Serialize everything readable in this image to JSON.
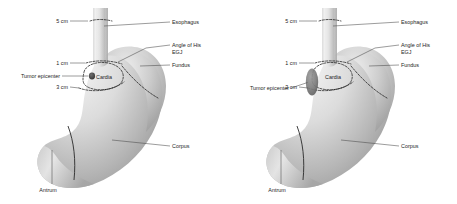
{
  "figure": {
    "background_color": "#ffffff",
    "ink_color": "#1d1d1d",
    "leader_color": "#4a4a4a",
    "dash_color": "#1b1b1b"
  },
  "labels": {
    "esophagus": "Esophagus",
    "angle_of_his": "Angle of His",
    "egj": "EGJ",
    "fundus": "Fundus",
    "corpus": "Corpus",
    "antrum": "Antrum",
    "cardia": "Cardia",
    "tumor_epicenter": "Tumor epicenter",
    "m5cm": "5 cm",
    "m1cm": "1 cm",
    "m3cm": "3 cm"
  },
  "panels": [
    {
      "id": "panel-left",
      "name": "stomach-diagram-left",
      "tumor": {
        "shape": "small-round",
        "cx": 92,
        "cy": 76,
        "rx": 3.1,
        "ry": 3.4
      },
      "tumor_label_y": 77,
      "tumor_leader": {
        "x1": 62,
        "y1": 76,
        "x2": 88.4,
        "y2": 76
      }
    },
    {
      "id": "panel-right",
      "name": "stomach-diagram-right",
      "tumor": {
        "shape": "large-oval",
        "cx": 83,
        "cy": 82,
        "rx": 6.2,
        "ry": 13.5
      },
      "tumor_label_y": 89,
      "tumor_leader": {
        "x1": 62,
        "y1": 88,
        "x2": 78.5,
        "y2": 82.5
      }
    }
  ],
  "measures": [
    {
      "key": "m5cm",
      "text": "5 cm",
      "x": 57,
      "y": 22.5
    },
    {
      "key": "m1cm",
      "text": "1 cm",
      "x": 57,
      "y": 64.5
    },
    {
      "key": "m3cm",
      "text": "3 cm",
      "x": 57,
      "y": 88.5
    }
  ],
  "right_labels": [
    {
      "key": "esophagus",
      "text": "Esophagus",
      "x": 172,
      "y": 24
    },
    {
      "key": "angle_of_his",
      "text": "Angle of His",
      "x": 172,
      "y": 47
    },
    {
      "key": "egj",
      "text": "EGJ",
      "x": 172,
      "y": 54
    },
    {
      "key": "fundus",
      "text": "Fundus",
      "x": 172,
      "y": 67
    },
    {
      "key": "corpus",
      "text": "Corpus",
      "x": 172,
      "y": 148
    }
  ],
  "bottom_labels": [
    {
      "key": "antrum",
      "text": "Antrum",
      "x": 32,
      "y": 190
    }
  ]
}
